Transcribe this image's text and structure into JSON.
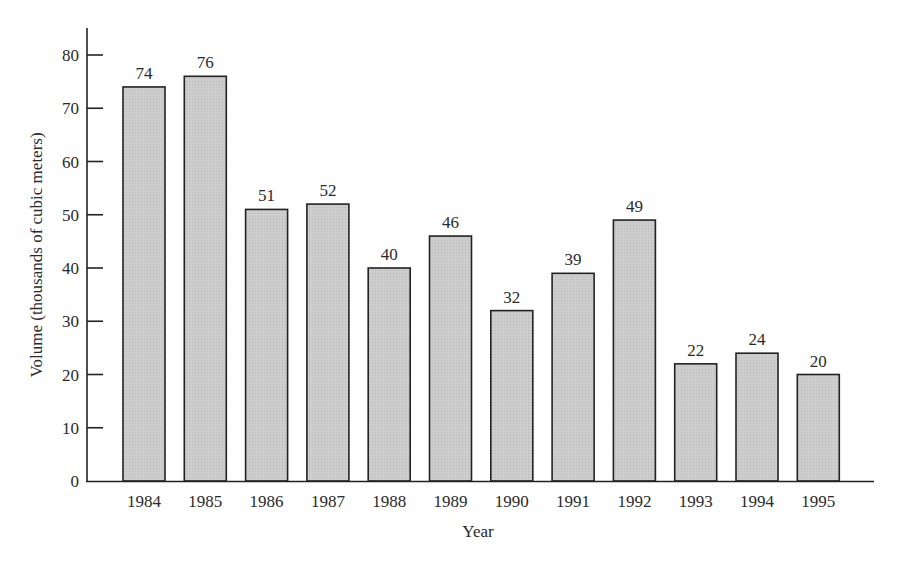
{
  "chart_data": {
    "type": "bar",
    "title": "",
    "xlabel": "Year",
    "ylabel": "Volume (thousands of cubic meters)",
    "categories": [
      "1984",
      "1985",
      "1986",
      "1987",
      "1988",
      "1989",
      "1990",
      "1991",
      "1992",
      "1993",
      "1994",
      "1995"
    ],
    "values": [
      74,
      76,
      51,
      52,
      40,
      46,
      32,
      39,
      49,
      22,
      24,
      20
    ],
    "ylim": [
      0,
      85
    ],
    "yticks": [
      0,
      10,
      20,
      30,
      40,
      50,
      60,
      70,
      80
    ],
    "grid": false,
    "legend": null,
    "data_labels": true,
    "bar_color": "#c9c9c9",
    "edge_color": "#222222"
  }
}
